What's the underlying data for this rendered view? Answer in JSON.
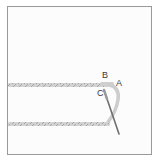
{
  "diagram": {
    "type": "embroidery-stitch-illustration",
    "labels": {
      "a": "A",
      "b": "B",
      "c": "C"
    },
    "colors": {
      "thread": "#c9c9c9",
      "thread_twist": "#a8a8a8",
      "needle": "#6e6e6e",
      "frame_border": "#9a9a9a",
      "fabric": "#fcfcfc"
    }
  }
}
